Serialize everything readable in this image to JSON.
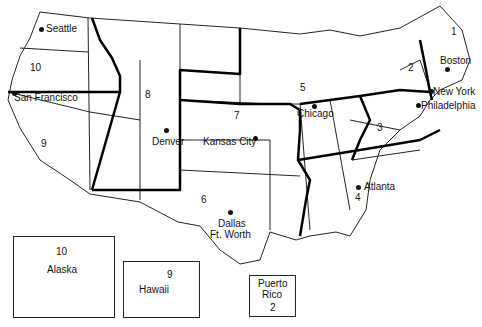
{
  "cities": [
    {
      "name": "Seattle",
      "x": 47,
      "y": 27
    },
    {
      "name": "San Francisco",
      "x": 14,
      "y": 98
    },
    {
      "name": "Denver",
      "x": 208,
      "y": 140
    },
    {
      "name": "Kansas City",
      "x": 254,
      "y": 137
    },
    {
      "name": "Chicago",
      "x": 314,
      "y": 105
    },
    {
      "name": "Boston",
      "x": 447,
      "y": 68
    },
    {
      "name": "New York",
      "x": 431,
      "y": 90
    },
    {
      "name": "Philadelphia",
      "x": 418,
      "y": 104
    },
    {
      "name": "Atlanta",
      "x": 357,
      "y": 186
    },
    {
      "name": "Dallas",
      "x": 229,
      "y": 212
    },
    {
      "name": "Ft. Worth",
      "x": 229,
      "y": 224
    }
  ],
  "regions": [
    {
      "num": "1",
      "x": 451,
      "y": 32
    },
    {
      "name": "2",
      "num": "2",
      "x": 411,
      "y": 68
    },
    {
      "num": "3",
      "x": 380,
      "y": 128
    },
    {
      "num": "4",
      "x": 358,
      "y": 198
    },
    {
      "num": "5",
      "x": 302,
      "y": 88
    },
    {
      "num": "6",
      "x": 204,
      "y": 200
    },
    {
      "num": "7",
      "x": 236,
      "y": 116
    },
    {
      "num": "8",
      "x": 148,
      "y": 95
    },
    {
      "num": "9",
      "x": 43,
      "y": 144
    },
    {
      "num": "10",
      "x": 33,
      "y": 68
    }
  ],
  "insets": {
    "alaska": {
      "label": "Alaska",
      "region": "10"
    },
    "hawaii": {
      "label": "Hawaii",
      "region": "9"
    },
    "puerto_rico": {
      "label_line1": "Puerto",
      "label_line2": "Rico",
      "region": "2"
    }
  }
}
